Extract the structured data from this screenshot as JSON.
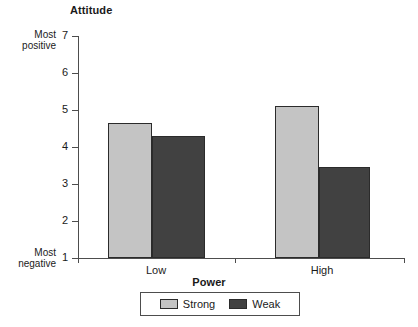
{
  "chart_data": {
    "type": "bar",
    "title": "",
    "xlabel": "Power",
    "ylabel": "Attitude",
    "categories": [
      "Low",
      "High"
    ],
    "series": [
      {
        "name": "Strong",
        "values": [
          4.65,
          5.1
        ],
        "color": "#c4c4c4"
      },
      {
        "name": "Weak",
        "values": [
          4.3,
          3.45
        ],
        "color": "#414141"
      }
    ],
    "ylim": [
      1,
      7
    ],
    "yticks": [
      7,
      6,
      5,
      4,
      3,
      2,
      1
    ],
    "ytick_labels": [
      "7",
      "6",
      "5",
      "4",
      "3",
      "2",
      "1"
    ],
    "y_axis_anchor_high": "Most positive",
    "y_axis_anchor_low": "Most negative",
    "grid": false,
    "legend_position": "bottom-center"
  },
  "axes": {
    "y_title": "Attitude",
    "x_title": "Power",
    "anchor_high_line1": "Most",
    "anchor_high_line2": "positive",
    "anchor_low_line1": "Most",
    "anchor_low_line2": "negative"
  },
  "y_ticks": [
    {
      "label": "7",
      "value": 7
    },
    {
      "label": "6",
      "value": 6
    },
    {
      "label": "5",
      "value": 5
    },
    {
      "label": "4",
      "value": 4
    },
    {
      "label": "3",
      "value": 3
    },
    {
      "label": "2",
      "value": 2
    },
    {
      "label": "1",
      "value": 1
    }
  ],
  "x_categories": [
    {
      "label": "Low"
    },
    {
      "label": "High"
    }
  ],
  "bars": [
    {
      "name": "bar-low-strong",
      "group": "Low",
      "series": "Strong",
      "value": 4.65,
      "color": "#c4c4c4"
    },
    {
      "name": "bar-low-weak",
      "group": "Low",
      "series": "Weak",
      "value": 4.3,
      "color": "#414141"
    },
    {
      "name": "bar-high-strong",
      "group": "High",
      "series": "Strong",
      "value": 5.1,
      "color": "#c4c4c4"
    },
    {
      "name": "bar-high-weak",
      "group": "High",
      "series": "Weak",
      "value": 3.45,
      "color": "#414141"
    }
  ],
  "legend": {
    "items": [
      {
        "label": "Strong",
        "color": "#c4c4c4"
      },
      {
        "label": "Weak",
        "color": "#414141"
      }
    ]
  },
  "colors": {
    "strong": "#c4c4c4",
    "weak": "#414141",
    "axis": "#4d4d4d",
    "bar_border": "#2b2b2b",
    "background": "#ffffff",
    "text": "#1a1a1a"
  }
}
